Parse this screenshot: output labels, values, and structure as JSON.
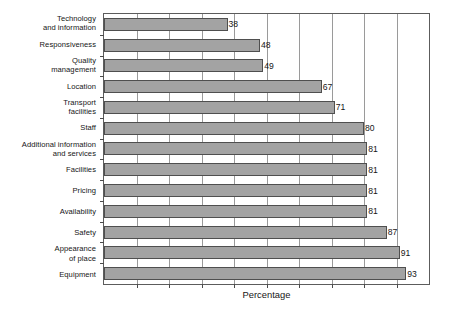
{
  "chart_data": {
    "type": "bar",
    "orientation": "horizontal",
    "title": "",
    "xlabel": "Percentage",
    "ylabel": "",
    "xlim": [
      0,
      100
    ],
    "grid": true,
    "gridline_interval": 10,
    "legend": "none",
    "bar_color": "#a3a3a3",
    "bar_border_color": "#4f4f4f",
    "show_value_labels": true,
    "tick_labels_x": [],
    "categories": [
      "Technology\nand information",
      "Responsiveness",
      "Quality\nmanagement",
      "Location",
      "Transport\nfacilities",
      "Staff",
      "Additional information\nand services",
      "Facilities",
      "Pricing",
      "Availability",
      "Safety",
      "Appearance\nof place",
      "Equipment"
    ],
    "values": [
      38,
      48,
      49,
      67,
      71,
      80,
      81,
      81,
      81,
      81,
      87,
      91,
      93
    ],
    "value_labels": [
      "38",
      "48",
      "49",
      "67",
      "71",
      "80",
      "81",
      "81",
      "81",
      "81",
      "87",
      "91",
      "93"
    ]
  }
}
